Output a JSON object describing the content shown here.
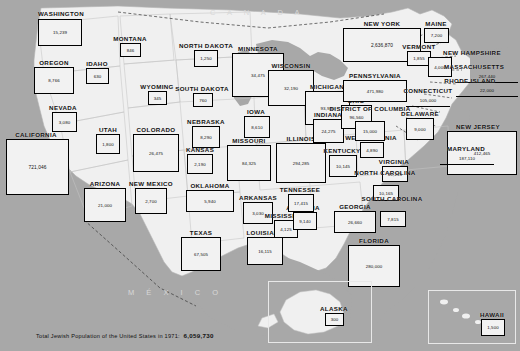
{
  "map": {
    "title_caption_prefix": "Total Jewish Population of the United States in 1971:",
    "title_caption_total": "6,059,730",
    "country_labels": [
      {
        "name": "canada-label",
        "text": "C A N A D A"
      },
      {
        "name": "mexico-label",
        "text": "M É X I C O"
      }
    ],
    "colors": {
      "ocean": "#a8a8a8",
      "land": "#f0f0f0",
      "box_fill": "#f2f2f2",
      "box_border": "#000000",
      "border_line": "#b8b8b8"
    },
    "states": [
      {
        "name": "washington",
        "label": "WASHINGTON",
        "value": "15,239"
      },
      {
        "name": "oregon",
        "label": "OREGON",
        "value": "8,766"
      },
      {
        "name": "idaho",
        "label": "IDAHO",
        "value": "630"
      },
      {
        "name": "montana",
        "label": "MONTANA",
        "value": "846"
      },
      {
        "name": "north-dakota",
        "label": "NORTH DAKOTA",
        "value": "1,250"
      },
      {
        "name": "south-dakota",
        "label": "SOUTH DAKOTA",
        "value": "760"
      },
      {
        "name": "minnesota",
        "label": "MINNESOTA",
        "value": "34,475"
      },
      {
        "name": "wisconsin",
        "label": "WISCONSIN",
        "value": "32,190"
      },
      {
        "name": "michigan",
        "label": "MICHIGAN",
        "value": "93,930"
      },
      {
        "name": "nevada",
        "label": "NEVADA",
        "value": "3,080"
      },
      {
        "name": "california",
        "label": "CALIFORNIA",
        "value": "721,046"
      },
      {
        "name": "utah",
        "label": "UTAH",
        "value": "1,800"
      },
      {
        "name": "wyoming",
        "label": "WYOMING",
        "value": "345"
      },
      {
        "name": "colorado",
        "label": "COLORADO",
        "value": "26,475"
      },
      {
        "name": "nebraska",
        "label": "NEBRASKA",
        "value": "8,290"
      },
      {
        "name": "iowa",
        "label": "IOWA",
        "value": "8,610"
      },
      {
        "name": "kansas",
        "label": "KANSAS",
        "value": "2,190"
      },
      {
        "name": "missouri",
        "label": "MISSOURI",
        "value": "84,325"
      },
      {
        "name": "illinois",
        "label": "ILLINOIS",
        "value": "294,285"
      },
      {
        "name": "indiana",
        "label": "INDIANA",
        "value": "24,275"
      },
      {
        "name": "ohio",
        "label": "OHIO",
        "value": "96,560"
      },
      {
        "name": "arizona",
        "label": "ARIZONA",
        "value": "21,000"
      },
      {
        "name": "new-mexico",
        "label": "NEW MEXICO",
        "value": "2,700"
      },
      {
        "name": "oklahoma",
        "label": "OKLAHOMA",
        "value": "5,940"
      },
      {
        "name": "arkansas",
        "label": "ARKANSAS",
        "value": "3,030"
      },
      {
        "name": "texas",
        "label": "TEXAS",
        "value": "67,505"
      },
      {
        "name": "louisiana",
        "label": "LOUISIANA",
        "value": "16,115"
      },
      {
        "name": "mississippi",
        "label": "MISSISSIPPI",
        "value": "4,125"
      },
      {
        "name": "alabama",
        "label": "ALABAMA",
        "value": "9,140"
      },
      {
        "name": "tennessee",
        "label": "TENNESSEE",
        "value": "17,415"
      },
      {
        "name": "kentucky",
        "label": "KENTUCKY",
        "value": "10,145"
      },
      {
        "name": "west-virginia",
        "label": "WEST VIRGINIA",
        "value": "4,890"
      },
      {
        "name": "virginia",
        "label": "VIRGINIA",
        "value": "41,215"
      },
      {
        "name": "north-carolina",
        "label": "NORTH CAROLINA",
        "value": "10,165"
      },
      {
        "name": "south-carolina",
        "label": "SOUTH CAROLINA",
        "value": "7,815"
      },
      {
        "name": "georgia",
        "label": "GEORGIA",
        "value": "26,660"
      },
      {
        "name": "florida",
        "label": "FLORIDA",
        "value": "280,000"
      },
      {
        "name": "new-york",
        "label": "NEW YORK",
        "value": "2,636,870"
      },
      {
        "name": "pennsylvania",
        "label": "PENNSYLVANIA",
        "value": "471,980"
      },
      {
        "name": "maine",
        "label": "MAINE",
        "value": "7,200"
      },
      {
        "name": "vermont",
        "label": "VERMONT",
        "value": "1,855"
      },
      {
        "name": "new-hampshire",
        "label": "NEW HAMPSHIRE",
        "value": "4,000"
      },
      {
        "name": "massachusetts",
        "label": "MASSACHUSETTS",
        "value": "267,440"
      },
      {
        "name": "rhode-island",
        "label": "RHODE ISLAND",
        "value": "22,000"
      },
      {
        "name": "connecticut",
        "label": "CONNECTICUT",
        "value": "105,000"
      },
      {
        "name": "new-jersey",
        "label": "NEW JERSEY",
        "value": "412,465"
      },
      {
        "name": "delaware",
        "label": "DELAWARE",
        "value": "9,000"
      },
      {
        "name": "maryland",
        "label": "MARYLAND",
        "value": "187,110"
      },
      {
        "name": "district-of-columbia",
        "label": "DISTRICT OF COLUMBIA",
        "value": "15,000"
      },
      {
        "name": "alaska",
        "label": "ALASKA",
        "value": "300"
      },
      {
        "name": "hawaii",
        "label": "HAWAII",
        "value": "1,500"
      }
    ]
  }
}
